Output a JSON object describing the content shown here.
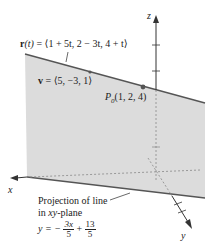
{
  "figure": {
    "line_equation": {
      "lhs": "r",
      "lhs_arg": "(t)",
      "rhs": " = ⟨1 + 5t, 2 − 3t, 4 + t⟩"
    },
    "direction_vector": {
      "name": "v",
      "value": " = ⟨5, −3, 1⟩"
    },
    "point": {
      "name": "P",
      "subscript": "0",
      "coords": "(1, 2, 4)"
    },
    "axes": {
      "x": "x",
      "y": "y",
      "z": "z"
    },
    "projection": {
      "caption_line1": "Projection of line",
      "caption_line2_prefix": "in ",
      "caption_line2_italic": "xy",
      "caption_line2_suffix": "-plane",
      "eq_lhs": "y = −",
      "frac1_num": "3x",
      "frac1_den": "5",
      "plus": " + ",
      "frac2_num": "13",
      "frac2_den": "5"
    },
    "colors": {
      "plane_fill": "#d9d9d9",
      "line": "#555555",
      "axis": "#333333",
      "dashed": "#8a8a8a"
    }
  }
}
